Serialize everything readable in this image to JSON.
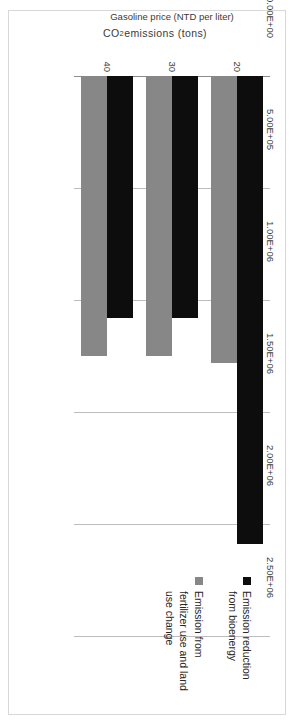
{
  "chart_data": {
    "type": "bar",
    "orientation": "vertical",
    "title": "",
    "xlabel": "Gasoline price (NTD per liter)",
    "ylabel": "CO2 emissions (tons)",
    "ylabel_parts": {
      "prefix": "CO",
      "sub": "2",
      "suffix": " emissions (tons)"
    },
    "categories": [
      "20",
      "30",
      "40"
    ],
    "ytick_labels": [
      "0.00E+00",
      "5.00E+05",
      "1.00E+06",
      "1.50E+06",
      "2.00E+06",
      "2.50E+06"
    ],
    "ytick_values": [
      0,
      500000,
      1000000,
      1500000,
      2000000,
      2500000
    ],
    "ylim": [
      0,
      2500000
    ],
    "grid": true,
    "legend_position": "top-right",
    "series": [
      {
        "name": "Emission reduction from bioenergy",
        "color": "#0d0d0d",
        "values": [
          2090000,
          1080000,
          1080000
        ]
      },
      {
        "name": "Emission from fertilizer use and land use change",
        "color": "#878787",
        "values": [
          1280000,
          1250000,
          1250000
        ]
      }
    ]
  },
  "legend": {
    "items": [
      {
        "label": "Emission reduction from bioenergy",
        "color": "#0d0d0d"
      },
      {
        "label": "Emission from fertilizer use and land use change",
        "color": "#878787"
      }
    ]
  },
  "axes": {
    "value_axis_title": "CO2 emissions (tons)",
    "category_axis_title": "Gasoline price (NTD per liter)"
  },
  "colors": {
    "series_0": "#0d0d0d",
    "series_1": "#878787",
    "gridline": "#bdbdbd",
    "axis": "#8c8c8c",
    "frame": "#d8d8d8",
    "text": "#3a3a3a",
    "background": "#ffffff"
  }
}
